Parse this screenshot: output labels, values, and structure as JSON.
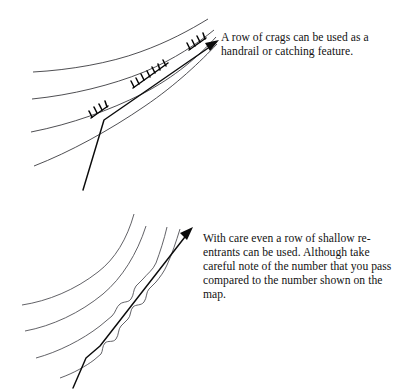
{
  "page": {
    "background_color": "#ffffff",
    "width": 403,
    "height": 389,
    "ink_color": "#121212",
    "contour_color": "#3b3b40",
    "route_color": "#0b0b0b",
    "cut_off_header_text": ""
  },
  "figures": [
    {
      "id": "crags-figure",
      "caption": "A row of crags can be used as a handrail or catching feature.",
      "feature_type": "crags",
      "contour_count": 4,
      "route_has_arrow": true,
      "crag_groups": 3
    },
    {
      "id": "reentrants-figure",
      "caption": "With care even a row of shallow re-entrants can be used. Although take careful note of the number that you pass compared to the number shown on the map.",
      "feature_type": "re-entrants",
      "contour_count": 4,
      "route_has_arrow": true,
      "reentrant_count": 4
    }
  ]
}
